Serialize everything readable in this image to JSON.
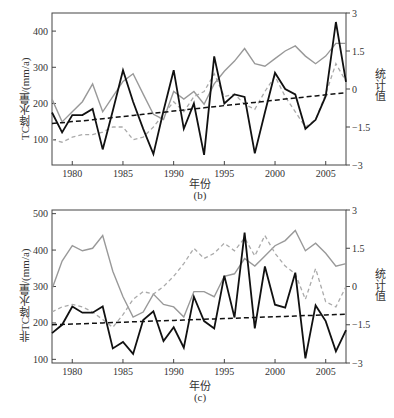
{
  "chart_data": [
    {
      "type": "line",
      "panel_label": "(b)",
      "xlabel": "年份",
      "ylabel": "TC降水量/(mm/a)",
      "y2label": "统计值",
      "xlim": [
        1978,
        2007
      ],
      "ylim": [
        30,
        450
      ],
      "y2lim": [
        -3,
        3
      ],
      "x_ticks": [
        1980,
        1985,
        1990,
        1995,
        2000,
        2005
      ],
      "y_ticks": [
        100,
        200,
        300,
        400
      ],
      "y2_ticks": [
        "3",
        "1.5",
        "0",
        "-1.5",
        "-3"
      ],
      "x": [
        1978,
        1979,
        1980,
        1981,
        1982,
        1983,
        1984,
        1985,
        1986,
        1987,
        1988,
        1989,
        1990,
        1991,
        1992,
        1993,
        1994,
        1995,
        1996,
        1997,
        1998,
        1999,
        2000,
        2001,
        2002,
        2003,
        2004,
        2005,
        2006,
        2007
      ],
      "series": [
        {
          "name": "TC降水量",
          "style": "solid-black",
          "axis": "left",
          "values": [
            175,
            120,
            168,
            168,
            185,
            73,
            180,
            292,
            205,
            130,
            60,
            180,
            292,
            130,
            200,
            58,
            330,
            200,
            225,
            218,
            62,
            175,
            285,
            240,
            225,
            130,
            155,
            220,
            425,
            260
          ]
        },
        {
          "name": "趋势线",
          "style": "dashed-black",
          "axis": "left",
          "values": [
            145,
            147,
            150,
            152,
            155,
            158,
            161,
            164,
            167,
            170,
            173,
            176,
            179,
            182,
            185,
            188,
            191,
            194,
            197,
            200,
            203,
            206,
            209,
            212,
            215,
            218,
            221,
            224,
            227,
            230
          ]
        },
        {
          "name": "统计值(实线)",
          "style": "solid-gray",
          "axis": "right",
          "values": [
            -0.4,
            -1.3,
            -0.9,
            -0.5,
            0.2,
            -0.9,
            -0.3,
            0.3,
            0.6,
            -0.2,
            -1.0,
            -1.2,
            -0.1,
            -0.4,
            -0.1,
            -0.6,
            0.2,
            0.7,
            1.1,
            1.6,
            1.0,
            0.9,
            1.2,
            1.5,
            1.7,
            1.3,
            1.0,
            1.3,
            1.8,
            1.8
          ]
        },
        {
          "name": "统计值(虚线)",
          "style": "dashed-gray",
          "axis": "right",
          "values": [
            -2.0,
            -2.1,
            -1.9,
            -1.8,
            -1.8,
            -1.7,
            -1.5,
            -1.5,
            -2.0,
            -1.9,
            -1.5,
            -1.0,
            -0.5,
            -0.9,
            -0.3,
            -0.1,
            0.6,
            -0.3,
            -0.2,
            -0.6,
            -0.8,
            -0.1,
            0.5,
            -0.3,
            -0.9,
            -1.5,
            -1.2,
            -0.2,
            1.0,
            0.3
          ]
        }
      ]
    },
    {
      "type": "line",
      "panel_label": "(c)",
      "xlabel": "年份",
      "ylabel": "非TC降水量/(mm/a)",
      "y2label": "统计值",
      "xlim": [
        1978,
        2007
      ],
      "ylim": [
        90,
        510
      ],
      "y2lim": [
        -3,
        3
      ],
      "x_ticks": [
        1980,
        1985,
        1990,
        1995,
        2000,
        2005
      ],
      "y_ticks": [
        100,
        200,
        300,
        400,
        500
      ],
      "y2_ticks": [
        "3",
        "1.5",
        "0",
        "-1.5",
        "-3"
      ],
      "x": [
        1978,
        1979,
        1980,
        1981,
        1982,
        1983,
        1984,
        1985,
        1986,
        1987,
        1988,
        1989,
        1990,
        1991,
        1992,
        1993,
        1994,
        1995,
        1996,
        1997,
        1998,
        1999,
        2000,
        2001,
        2002,
        2003,
        2004,
        2005,
        2006,
        2007
      ],
      "series": [
        {
          "name": "非TC降水量",
          "style": "solid-black",
          "axis": "left",
          "values": [
            172,
            195,
            245,
            228,
            228,
            245,
            130,
            148,
            115,
            208,
            232,
            150,
            188,
            132,
            272,
            205,
            185,
            330,
            215,
            448,
            185,
            355,
            250,
            242,
            338,
            103,
            248,
            205,
            122,
            180
          ]
        },
        {
          "name": "趋势线",
          "style": "dashed-black",
          "axis": "left",
          "values": [
            195,
            196,
            197,
            198,
            199,
            200,
            201,
            202,
            203,
            204,
            205,
            206,
            207,
            208,
            209,
            210,
            211,
            212,
            213,
            214,
            215,
            216,
            217,
            218,
            219,
            220,
            221,
            222,
            223,
            224
          ]
        },
        {
          "name": "统计值(实线)",
          "style": "solid-gray",
          "axis": "right",
          "values": [
            -0.1,
            1.0,
            1.6,
            1.4,
            1.5,
            2.0,
            0.6,
            -0.4,
            -1.2,
            -1.0,
            -0.3,
            -0.7,
            -0.8,
            -1.2,
            -0.2,
            -0.2,
            -0.4,
            0.4,
            0.5,
            1.1,
            0.8,
            1.2,
            1.6,
            1.8,
            2.2,
            1.4,
            1.7,
            1.3,
            0.8,
            0.9
          ]
        },
        {
          "name": "统计值(虚线)",
          "style": "dashed-gray",
          "axis": "right",
          "values": [
            -1.0,
            -0.8,
            -0.7,
            -0.8,
            -1.0,
            -1.3,
            -1.6,
            -1.1,
            -0.5,
            -0.2,
            -0.3,
            0.0,
            0.4,
            0.9,
            1.5,
            1.1,
            1.3,
            1.7,
            1.4,
            1.9,
            1.2,
            2.0,
            1.3,
            0.8,
            0.5,
            -0.5,
            0.7,
            -0.6,
            -0.8,
            0.0
          ]
        }
      ]
    }
  ],
  "panels": {
    "b": {
      "ylabel": "TC降水量/(mm/a)",
      "y2label": "统计值",
      "xlabel": "年份",
      "label": "(b)"
    },
    "c": {
      "ylabel": "非TC降水量/(mm/a)",
      "y2label": "统计值",
      "xlabel": "年份",
      "label": "(c)"
    }
  }
}
